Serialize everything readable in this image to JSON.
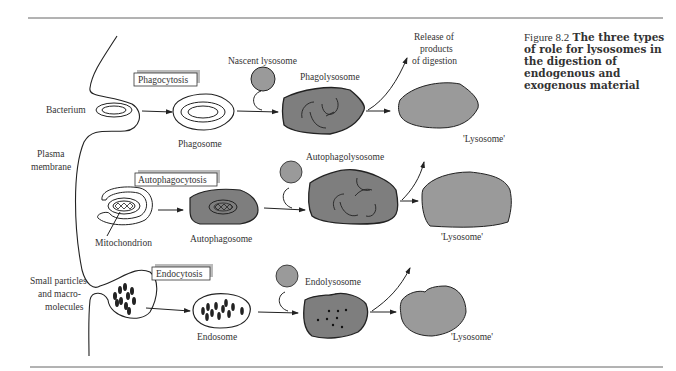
{
  "figure": {
    "number": "Figure 8.2",
    "title": "The three types of role for lysosomes in the digestion of endogenous and exogenous material"
  },
  "colors": {
    "lysosome_fill": "#9a9a9a",
    "dark_fill": "#7e7e7e",
    "stroke": "#222222",
    "rule": "#666666"
  },
  "labels": {
    "plasma_membrane_1": "Plasma",
    "plasma_membrane_2": "membrane",
    "release_1": "Release of",
    "release_2": "products",
    "release_3": "of digestion"
  },
  "rows": [
    {
      "process": "Phagocytosis",
      "input_label": "Bacterium",
      "vesicle_label": "Phagosome",
      "nascent_label": "Nascent lysosome",
      "fused_label": "Phagolysosome",
      "result_label": "'Lysosome'"
    },
    {
      "process": "Autophagocytosis",
      "input_label": "Mitochondrion",
      "vesicle_label": "Autophagosome",
      "fused_label": "Autophagolysosome",
      "result_label": "'Lysosome'"
    },
    {
      "process": "Endocytosis",
      "input_label_1": "Small particles",
      "input_label_2": "and macro-",
      "input_label_3": "molecules",
      "vesicle_label": "Endosome",
      "fused_label": "Endolysosome",
      "result_label": "'Lysosome'"
    }
  ]
}
